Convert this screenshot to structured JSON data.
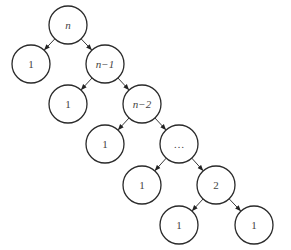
{
  "diagram": {
    "type": "recursion-tree",
    "radius": 19,
    "nodes": [
      {
        "id": "n0",
        "label": "n",
        "italic": true,
        "x": 68,
        "y": 25
      },
      {
        "id": "n1",
        "label": "1",
        "italic": false,
        "x": 31,
        "y": 64
      },
      {
        "id": "n2",
        "label": "n−1",
        "italic": true,
        "x": 105,
        "y": 64
      },
      {
        "id": "n3",
        "label": "1",
        "italic": false,
        "x": 68,
        "y": 104
      },
      {
        "id": "n4",
        "label": "n−2",
        "italic": true,
        "x": 142,
        "y": 104
      },
      {
        "id": "n5",
        "label": "1",
        "italic": false,
        "x": 105,
        "y": 144
      },
      {
        "id": "n6",
        "label": "…",
        "italic": false,
        "x": 179,
        "y": 144
      },
      {
        "id": "n7",
        "label": "1",
        "italic": false,
        "x": 142,
        "y": 185
      },
      {
        "id": "n8",
        "label": "2",
        "italic": false,
        "x": 216,
        "y": 185
      },
      {
        "id": "n9",
        "label": "1",
        "italic": false,
        "x": 179,
        "y": 225
      },
      {
        "id": "n10",
        "label": "1",
        "italic": false,
        "x": 254,
        "y": 225
      }
    ],
    "edges": [
      [
        "n0",
        "n1"
      ],
      [
        "n0",
        "n2"
      ],
      [
        "n2",
        "n3"
      ],
      [
        "n2",
        "n4"
      ],
      [
        "n4",
        "n5"
      ],
      [
        "n4",
        "n6"
      ],
      [
        "n6",
        "n7"
      ],
      [
        "n6",
        "n8"
      ],
      [
        "n8",
        "n9"
      ],
      [
        "n8",
        "n10"
      ]
    ]
  }
}
